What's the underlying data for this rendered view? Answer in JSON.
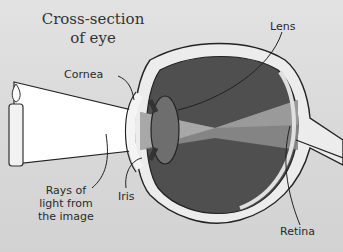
{
  "diagram": {
    "title_line1": "Cross-section",
    "title_line2": "of eye",
    "labels": {
      "cornea": "Cornea",
      "lens": "Lens",
      "iris": "Iris",
      "retina": "Retina",
      "rays_line1": "Rays of",
      "rays_line2": "light from",
      "rays_line3": "the image"
    },
    "colors": {
      "background": "#d9d9d9",
      "eye_interior": "#5a5a5a",
      "light_beam": "#ffffff",
      "outline": "#222222"
    }
  }
}
